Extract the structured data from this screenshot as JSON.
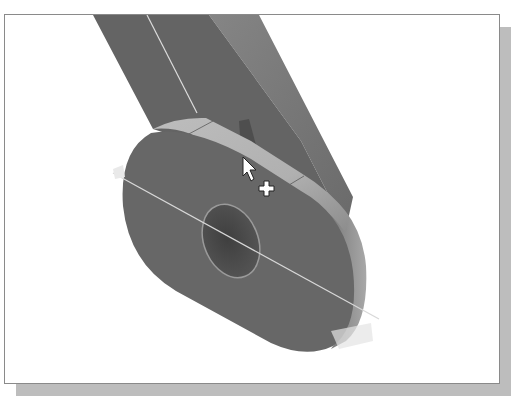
{
  "viewport": {
    "type": "3d-model-view",
    "model": "link-arm-with-hole",
    "highlighted_face": "cylindrical-edge-face",
    "cursor": "select-arrow-plus-icon"
  },
  "colors": {
    "background": "#ffffff",
    "frame_border": "#8a8a8a",
    "shadow": "#bdbdbd",
    "part_dark": "#5f5f5f",
    "part_mid": "#6e6e6e",
    "part_light": "#8a8a8a",
    "highlight_face": "#b5b5b5",
    "hole": "#4a4a4a",
    "edge_line": "#e0e0e0"
  }
}
